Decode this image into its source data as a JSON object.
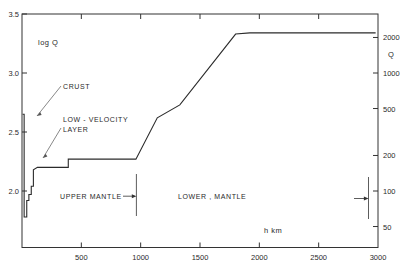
{
  "chart_data": {
    "type": "line",
    "title": "",
    "xlabel": "h   km",
    "ylabel": "log Q",
    "ylabel_right": "Q",
    "xlim": [
      0,
      3000
    ],
    "ylim": [
      1.7,
      3.5
    ],
    "grid": false,
    "legend": "none",
    "x_ticks": [
      0,
      500,
      1000,
      1500,
      2000,
      2500,
      3000
    ],
    "x_tick_labels": [
      "",
      "500",
      "1000",
      "1500",
      "2000",
      "2500",
      "3000"
    ],
    "y_ticks_left": [
      2.0,
      2.5,
      3.0,
      3.5
    ],
    "y_tick_labels_left": [
      "2.0",
      "2.5",
      "3.0",
      "3.5"
    ],
    "y_ticks_right_values": [
      50,
      100,
      200,
      500,
      1000,
      2000
    ],
    "y_tick_labels_right": [
      "50",
      "100",
      "200",
      "500",
      "1000",
      "2000"
    ],
    "series": [
      {
        "name": "log Q vs depth",
        "points": [
          {
            "h": 5,
            "logQ": 2.65
          },
          {
            "h": 18,
            "logQ": 2.65
          },
          {
            "h": 18,
            "logQ": 1.78
          },
          {
            "h": 40,
            "logQ": 1.78
          },
          {
            "h": 40,
            "logQ": 1.92
          },
          {
            "h": 58,
            "logQ": 1.92
          },
          {
            "h": 58,
            "logQ": 1.97
          },
          {
            "h": 78,
            "logQ": 1.97
          },
          {
            "h": 78,
            "logQ": 2.04
          },
          {
            "h": 96,
            "logQ": 2.04
          },
          {
            "h": 96,
            "logQ": 2.18
          },
          {
            "h": 130,
            "logQ": 2.2
          },
          {
            "h": 390,
            "logQ": 2.2
          },
          {
            "h": 390,
            "logQ": 2.27
          },
          {
            "h": 430,
            "logQ": 2.27
          },
          {
            "h": 960,
            "logQ": 2.27
          },
          {
            "h": 1140,
            "logQ": 2.62
          },
          {
            "h": 1330,
            "logQ": 2.73
          },
          {
            "h": 1800,
            "logQ": 3.33
          },
          {
            "h": 1920,
            "logQ": 3.34
          },
          {
            "h": 2980,
            "logQ": 3.34
          }
        ]
      }
    ],
    "annotations": [
      {
        "id": "crust",
        "text": "CRUST",
        "target_h": 30,
        "target_logQ": 2.7
      },
      {
        "id": "low-velocity-layer",
        "text_line1": "LOW - VELOCITY",
        "text_line2": "LAYER",
        "target_h": 55,
        "target_logQ": 2.3
      },
      {
        "id": "upper-mantle",
        "text": "UPPER  MANTLE",
        "range_h": [
          140,
          960
        ]
      },
      {
        "id": "lower-mantle",
        "text": "LOWER , MANTLE",
        "range_h": [
          1000,
          2920
        ]
      }
    ],
    "region_dividers_h": [
      960,
      2920
    ]
  },
  "labels": {
    "log_q": "log Q",
    "q_right": "Q",
    "h_km": "h    km",
    "crust": "CRUST",
    "lvl_line1": "LOW - VELOCITY",
    "lvl_line2": "LAYER",
    "upper_mantle": "UPPER  MANTLE",
    "lower_mantle": "LOWER , MANTLE"
  },
  "colors": {
    "curve": "#2b2b2b",
    "axis": "#333333",
    "text": "#2a2a2a",
    "background": "#ffffff"
  }
}
